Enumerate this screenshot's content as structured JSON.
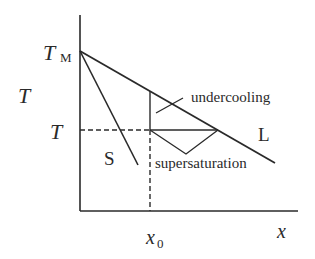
{
  "diagram": {
    "labels": {
      "temp_melting_T": "T",
      "temp_melting_sub": "M",
      "y_axis": "T",
      "temp_level": "T",
      "solidus": "S",
      "liquidus": "L",
      "undercooling": "undercooling",
      "supersaturation": "supersaturation",
      "composition_x": "x",
      "composition_sub": "0",
      "x_axis": "x"
    },
    "colors": {
      "line": "#2a2a2a",
      "background": "#ffffff"
    }
  }
}
